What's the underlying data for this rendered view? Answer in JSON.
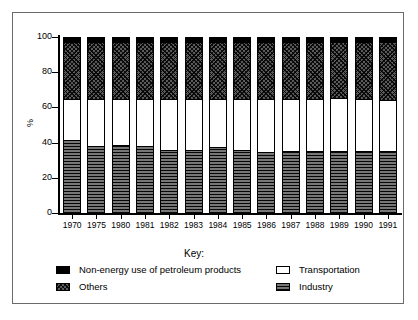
{
  "chart_data": {
    "type": "bar",
    "subtype": "stacked-bar-100-percent",
    "title": "",
    "xlabel": "",
    "ylabel": "%",
    "ylim": [
      0,
      100
    ],
    "yticks": [
      0,
      20,
      40,
      60,
      80,
      100
    ],
    "grid": false,
    "legend_position": "bottom",
    "legend_title": "Key:",
    "categories": [
      "1970",
      "1975",
      "1980",
      "1981",
      "1982",
      "1983",
      "1984",
      "1985",
      "1986",
      "1987",
      "1988",
      "1989",
      "1990",
      "1991"
    ],
    "series": [
      {
        "name": "Industry",
        "pattern": "horizontal-lines-dark",
        "values": [
          41,
          37.5,
          38,
          37.5,
          35.5,
          35.5,
          37,
          35.5,
          34,
          34.5,
          34.5,
          34.5,
          34.5,
          34.5
        ]
      },
      {
        "name": "Transportation",
        "pattern": "solid-white",
        "values": [
          23,
          26.5,
          26,
          26.5,
          28.5,
          28.5,
          27,
          28.5,
          30,
          29.5,
          29.5,
          30.5,
          29.5,
          29
        ]
      },
      {
        "name": "Others",
        "pattern": "crosshatch-dark",
        "values": [
          32.5,
          32.5,
          32.5,
          32.5,
          32.5,
          32.5,
          32.5,
          32.5,
          32.5,
          32.5,
          32.5,
          31.5,
          32.5,
          33
        ]
      },
      {
        "name": "Non-energy use of petroleum products",
        "pattern": "solid-black",
        "values": [
          3.5,
          3.5,
          3.5,
          3.5,
          3.5,
          3.5,
          3.5,
          3.5,
          3.5,
          3.5,
          3.5,
          3.5,
          3.5,
          3.5
        ]
      }
    ],
    "stack_order_bottom_to_top": [
      "Industry",
      "Transportation",
      "Others",
      "Non-energy use of petroleum products"
    ]
  },
  "axes": {
    "y_title": "%",
    "y_tick_labels": [
      "100",
      "80",
      "60",
      "40",
      "20",
      "0"
    ],
    "x_tick_labels": [
      "1970",
      "1975",
      "1980",
      "1981",
      "1982",
      "1983",
      "1984",
      "1985",
      "1986",
      "1987",
      "1988",
      "1989",
      "1990",
      "1991"
    ]
  },
  "legend": {
    "title": "Key:",
    "entries": [
      {
        "label": "Non-energy use of petroleum products",
        "swatch": "solid-black"
      },
      {
        "label": "Transportation",
        "swatch": "solid-white"
      },
      {
        "label": "Others",
        "swatch": "crosshatch-dark"
      },
      {
        "label": "Industry",
        "swatch": "horizontal-lines-dark"
      }
    ]
  },
  "colors": {
    "frame": "#6b6b6b",
    "axis": "#000000",
    "nonenergy": "#000000",
    "others": "#5a5a5a",
    "transportation": "#ffffff",
    "industry": "#4a4a4a",
    "background": "#ffffff"
  }
}
